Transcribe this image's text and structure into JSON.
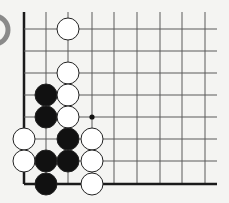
{
  "board": {
    "grid_x": [
      24,
      46,
      68,
      92,
      114,
      137,
      160,
      182,
      205
    ],
    "grid_y": [
      29,
      51,
      73,
      95,
      117,
      139,
      161,
      184
    ],
    "top_extent": 12,
    "right_extent": 217,
    "line_color": "#5a5a5a",
    "edge_color": "#1a1a1a",
    "stone_radius": 11,
    "stones": [
      {
        "color": "white",
        "col": 2,
        "row": 0
      },
      {
        "color": "white",
        "col": 2,
        "row": 2
      },
      {
        "color": "black",
        "col": 1,
        "row": 3
      },
      {
        "color": "white",
        "col": 2,
        "row": 3
      },
      {
        "color": "black",
        "col": 1,
        "row": 4
      },
      {
        "color": "white",
        "col": 2,
        "row": 4
      },
      {
        "color": "white",
        "col": 0,
        "row": 5
      },
      {
        "color": "black",
        "col": 2,
        "row": 5
      },
      {
        "color": "white",
        "col": 3,
        "row": 5
      },
      {
        "color": "white",
        "col": 0,
        "row": 6
      },
      {
        "color": "black",
        "col": 1,
        "row": 6
      },
      {
        "color": "black",
        "col": 2,
        "row": 6
      },
      {
        "color": "white",
        "col": 3,
        "row": 6
      },
      {
        "color": "black",
        "col": 1,
        "row": 7
      },
      {
        "color": "white",
        "col": 3,
        "row": 7
      }
    ],
    "markers": [
      {
        "type": "dot",
        "col": 3,
        "row": 4
      }
    ],
    "partial_stone": {
      "cx": -6,
      "cy": 30,
      "r": 14,
      "color": "#8a8a8a"
    }
  }
}
